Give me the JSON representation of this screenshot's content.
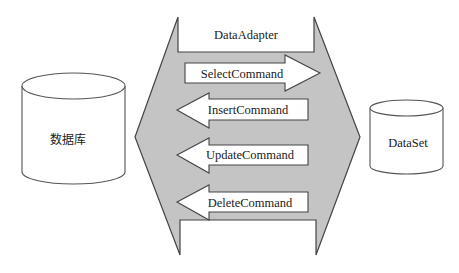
{
  "diagram": {
    "adapter": {
      "label": "DataAdapter",
      "fill": "#c4c4c4"
    },
    "database": {
      "label": "数据库"
    },
    "dataset": {
      "label": "DataSet"
    },
    "commands": [
      {
        "label": "SelectCommand",
        "direction": "right"
      },
      {
        "label": "InsertCommand",
        "direction": "left"
      },
      {
        "label": "UpdateCommand",
        "direction": "left"
      },
      {
        "label": "DeleteCommand",
        "direction": "left"
      }
    ]
  }
}
